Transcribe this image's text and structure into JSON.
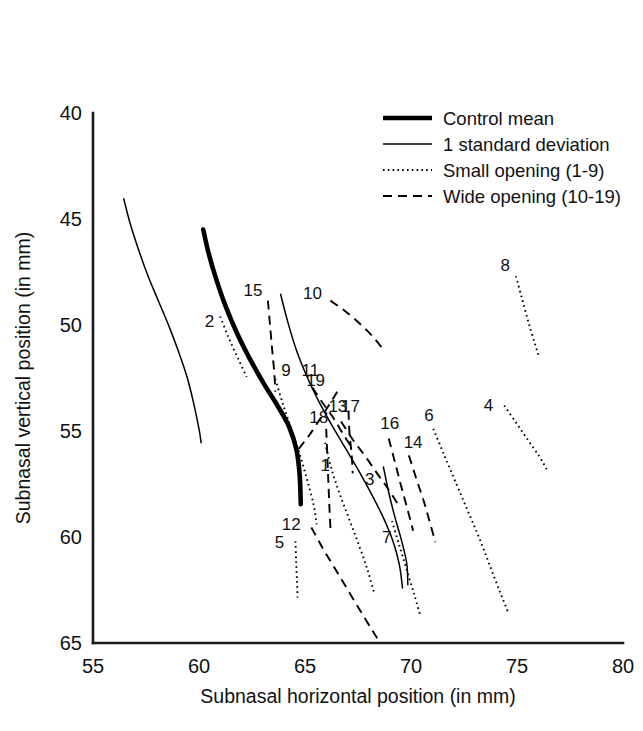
{
  "chart_data": {
    "type": "line",
    "title": "",
    "subtitle": "",
    "xlabel": "Subnasal horizontal position (in mm)",
    "ylabel": "Subnasal vertical position (in mm)",
    "xlim": [
      55,
      80
    ],
    "ylim": [
      40,
      65
    ],
    "y_inverted": true,
    "grid": false,
    "xticks": [
      "55",
      "60",
      "65",
      "70",
      "75",
      "80"
    ],
    "yticks": [
      "40",
      "45",
      "50",
      "55",
      "60",
      "65"
    ],
    "legend_position": "upper-right",
    "legend": [
      {
        "key": "control-mean",
        "label": "Control mean",
        "style": "thick-solid"
      },
      {
        "key": "standard-deviation",
        "label": "1 standard deviation",
        "style": "thin-solid"
      },
      {
        "key": "small-opening",
        "label": "Small opening (1-9)",
        "style": "dotted"
      },
      {
        "key": "wide-opening",
        "label": "Wide opening (10-19)",
        "style": "dashed"
      }
    ],
    "series": [
      {
        "name": "Control mean",
        "style": "thick-solid",
        "label": "",
        "points": [
          [
            60.2,
            45.5
          ],
          [
            60.45,
            46.6
          ],
          [
            60.8,
            47.8
          ],
          [
            61.25,
            49.1
          ],
          [
            61.8,
            50.4
          ],
          [
            62.4,
            51.6
          ],
          [
            63.05,
            52.75
          ],
          [
            63.7,
            53.8
          ],
          [
            64.25,
            54.8
          ],
          [
            64.6,
            55.9
          ],
          [
            64.75,
            57.1
          ],
          [
            64.8,
            58.45
          ]
        ]
      },
      {
        "name": "1 standard deviation (lower)",
        "style": "thin-solid",
        "label": "",
        "points": [
          [
            56.45,
            44.05
          ],
          [
            56.75,
            45.2
          ],
          [
            57.15,
            46.45
          ],
          [
            57.6,
            47.7
          ],
          [
            58.1,
            48.9
          ],
          [
            58.6,
            50.1
          ],
          [
            59.05,
            51.3
          ],
          [
            59.45,
            52.5
          ],
          [
            59.75,
            53.7
          ],
          [
            60.0,
            54.9
          ],
          [
            60.1,
            55.55
          ]
        ]
      },
      {
        "name": "1 standard deviation (upper)",
        "style": "thin-solid",
        "label": "",
        "points": [
          [
            63.85,
            48.55
          ],
          [
            64.2,
            49.9
          ],
          [
            64.6,
            51.2
          ],
          [
            65.1,
            52.45
          ],
          [
            65.65,
            53.6
          ],
          [
            66.25,
            54.7
          ],
          [
            66.9,
            55.8
          ],
          [
            67.55,
            56.9
          ],
          [
            68.15,
            58.0
          ],
          [
            68.7,
            59.1
          ],
          [
            69.15,
            60.2
          ],
          [
            69.45,
            61.3
          ],
          [
            69.6,
            62.4
          ]
        ]
      },
      {
        "name": "1",
        "group": "small-opening",
        "style": "dotted",
        "label": "1",
        "points": [
          [
            65.95,
            55.55
          ],
          [
            66.25,
            56.8
          ],
          [
            66.65,
            58.0
          ],
          [
            67.1,
            59.2
          ],
          [
            67.55,
            60.4
          ],
          [
            67.95,
            61.55
          ],
          [
            68.25,
            62.6
          ]
        ]
      },
      {
        "name": "2",
        "group": "small-opening",
        "style": "dotted",
        "label": "2",
        "points": [
          [
            61.0,
            49.6
          ],
          [
            61.4,
            50.6
          ],
          [
            61.85,
            51.6
          ],
          [
            62.25,
            52.45
          ]
        ]
      },
      {
        "name": "3",
        "group": "small-opening",
        "style": "solid-short",
        "label": "3",
        "points": [
          [
            68.7,
            56.7
          ],
          [
            68.95,
            57.9
          ],
          [
            69.25,
            59.1
          ],
          [
            69.55,
            60.15
          ],
          [
            69.8,
            61.25
          ],
          [
            69.85,
            62.25
          ]
        ]
      },
      {
        "name": "4",
        "group": "small-opening",
        "style": "dotted",
        "label": "4",
        "points": [
          [
            74.4,
            53.8
          ],
          [
            74.95,
            54.6
          ],
          [
            75.5,
            55.4
          ],
          [
            76.05,
            56.2
          ],
          [
            76.4,
            56.8
          ]
        ]
      },
      {
        "name": "5",
        "group": "small-opening",
        "style": "dotted",
        "label": "5",
        "points": [
          [
            64.55,
            60.2
          ],
          [
            64.58,
            61.1
          ],
          [
            64.62,
            62.0
          ],
          [
            64.65,
            62.85
          ]
        ]
      },
      {
        "name": "6",
        "group": "small-opening",
        "style": "dotted",
        "label": "6",
        "points": [
          [
            71.05,
            54.9
          ],
          [
            71.55,
            56.1
          ],
          [
            72.1,
            57.4
          ],
          [
            72.65,
            58.7
          ],
          [
            73.2,
            60.0
          ],
          [
            73.7,
            61.3
          ],
          [
            74.2,
            62.6
          ],
          [
            74.6,
            63.6
          ]
        ]
      },
      {
        "name": "7",
        "group": "small-opening",
        "style": "dotted",
        "label": "7",
        "points": [
          [
            69.1,
            59.25
          ],
          [
            69.45,
            60.4
          ],
          [
            69.8,
            61.55
          ],
          [
            70.15,
            62.7
          ],
          [
            70.45,
            63.75
          ]
        ]
      },
      {
        "name": "8",
        "group": "small-opening",
        "style": "dotted",
        "label": "8",
        "points": [
          [
            74.95,
            47.7
          ],
          [
            75.25,
            48.8
          ],
          [
            75.55,
            49.9
          ],
          [
            75.85,
            50.9
          ],
          [
            76.05,
            51.55
          ]
        ]
      },
      {
        "name": "9",
        "group": "small-opening",
        "style": "dotted",
        "label": "9",
        "points": [
          [
            63.6,
            52.55
          ],
          [
            63.95,
            53.7
          ],
          [
            64.35,
            54.9
          ],
          [
            64.75,
            56.1
          ],
          [
            65.1,
            57.3
          ],
          [
            65.4,
            58.45
          ],
          [
            65.55,
            59.4
          ]
        ]
      },
      {
        "name": "10",
        "group": "wide-opening",
        "style": "dashed",
        "label": "10",
        "points": [
          [
            66.2,
            48.85
          ],
          [
            66.9,
            49.35
          ],
          [
            67.6,
            49.95
          ],
          [
            68.2,
            50.55
          ],
          [
            68.65,
            51.1
          ]
        ]
      },
      {
        "name": "11",
        "group": "wide-opening",
        "style": "dashed",
        "label": "11",
        "points": [
          [
            65.35,
            52.95
          ],
          [
            65.85,
            53.7
          ],
          [
            66.35,
            54.4
          ],
          [
            66.8,
            55.15
          ],
          [
            67.25,
            55.85
          ]
        ]
      },
      {
        "name": "12",
        "group": "wide-opening",
        "style": "dashed",
        "label": "12",
        "points": [
          [
            65.3,
            59.55
          ],
          [
            65.85,
            60.55
          ],
          [
            66.45,
            61.55
          ],
          [
            67.05,
            62.55
          ],
          [
            67.65,
            63.55
          ],
          [
            68.2,
            64.45
          ],
          [
            68.55,
            65.0
          ]
        ]
      },
      {
        "name": "13",
        "group": "wide-opening",
        "style": "dashed",
        "label": "13",
        "points": [
          [
            66.7,
            54.55
          ],
          [
            67.25,
            55.4
          ],
          [
            67.85,
            56.2
          ],
          [
            68.4,
            57.0
          ],
          [
            68.9,
            57.7
          ],
          [
            69.35,
            58.4
          ]
        ]
      },
      {
        "name": "14",
        "group": "wide-opening",
        "style": "dashed",
        "label": "14",
        "points": [
          [
            69.9,
            56.15
          ],
          [
            70.25,
            57.25
          ],
          [
            70.6,
            58.3
          ],
          [
            70.9,
            59.35
          ],
          [
            71.15,
            60.25
          ]
        ]
      },
      {
        "name": "15",
        "group": "wide-opening",
        "style": "dashed",
        "label": "15",
        "points": [
          [
            63.25,
            48.85
          ],
          [
            63.35,
            50.0
          ],
          [
            63.45,
            51.15
          ],
          [
            63.55,
            52.25
          ],
          [
            63.6,
            53.15
          ]
        ]
      },
      {
        "name": "16",
        "group": "wide-opening",
        "style": "dashed",
        "label": "16",
        "points": [
          [
            68.95,
            55.35
          ],
          [
            69.25,
            56.5
          ],
          [
            69.55,
            57.65
          ],
          [
            69.85,
            58.75
          ],
          [
            70.1,
            59.7
          ]
        ]
      },
      {
        "name": "17",
        "group": "wide-opening",
        "style": "dashed",
        "label": "17",
        "points": [
          [
            67.05,
            54.05
          ],
          [
            67.1,
            55.1
          ],
          [
            67.2,
            56.1
          ],
          [
            67.25,
            57.0
          ]
        ]
      },
      {
        "name": "18",
        "group": "wide-opening",
        "style": "dashed",
        "label": "18",
        "points": [
          [
            66.0,
            54.9
          ],
          [
            66.05,
            56.1
          ],
          [
            66.1,
            57.35
          ],
          [
            66.15,
            58.55
          ],
          [
            66.2,
            59.6
          ]
        ]
      },
      {
        "name": "19",
        "group": "wide-opening",
        "style": "dashed",
        "label": "19",
        "points": [
          [
            64.7,
            55.85
          ],
          [
            65.2,
            55.2
          ],
          [
            65.7,
            54.45
          ],
          [
            66.15,
            53.75
          ],
          [
            66.55,
            53.1
          ]
        ]
      }
    ],
    "curve_labels": [
      {
        "text": "1",
        "x": 65.95,
        "y": 56.9
      },
      {
        "text": "2",
        "x": 60.5,
        "y": 50.1
      },
      {
        "text": "3",
        "x": 68.05,
        "y": 57.55
      },
      {
        "text": "4",
        "x": 73.65,
        "y": 54.05
      },
      {
        "text": "5",
        "x": 63.8,
        "y": 60.5
      },
      {
        "text": "6",
        "x": 70.85,
        "y": 54.55
      },
      {
        "text": "7",
        "x": 68.85,
        "y": 60.3
      },
      {
        "text": "8",
        "x": 74.45,
        "y": 47.45
      },
      {
        "text": "9",
        "x": 64.1,
        "y": 52.4
      },
      {
        "text": "10",
        "x": 65.35,
        "y": 48.75
      },
      {
        "text": "11",
        "x": 65.25,
        "y": 52.4
      },
      {
        "text": "12",
        "x": 64.35,
        "y": 59.65
      },
      {
        "text": "13",
        "x": 66.55,
        "y": 54.1
      },
      {
        "text": "14",
        "x": 70.1,
        "y": 55.8
      },
      {
        "text": "15",
        "x": 62.55,
        "y": 48.65
      },
      {
        "text": "16",
        "x": 69.0,
        "y": 54.9
      },
      {
        "text": "17",
        "x": 67.15,
        "y": 54.1
      },
      {
        "text": "18",
        "x": 65.65,
        "y": 54.6
      },
      {
        "text": "19",
        "x": 65.5,
        "y": 52.9
      }
    ]
  },
  "axes": {
    "x_title": "Subnasal horizontal position (in mm)",
    "y_title": "Subnasal vertical position (in mm)",
    "x_ticks": [
      "55",
      "60",
      "65",
      "70",
      "75",
      "80"
    ],
    "y_ticks": [
      "40",
      "45",
      "50",
      "55",
      "60",
      "65"
    ]
  },
  "legend": {
    "items": [
      {
        "label": "Control mean"
      },
      {
        "label": "1 standard deviation"
      },
      {
        "label": "Small opening (1-9)"
      },
      {
        "label": "Wide opening (10-19)"
      }
    ]
  },
  "colors": {
    "ink": "#000000",
    "axis": "#1a1a1a",
    "background": "#ffffff"
  }
}
